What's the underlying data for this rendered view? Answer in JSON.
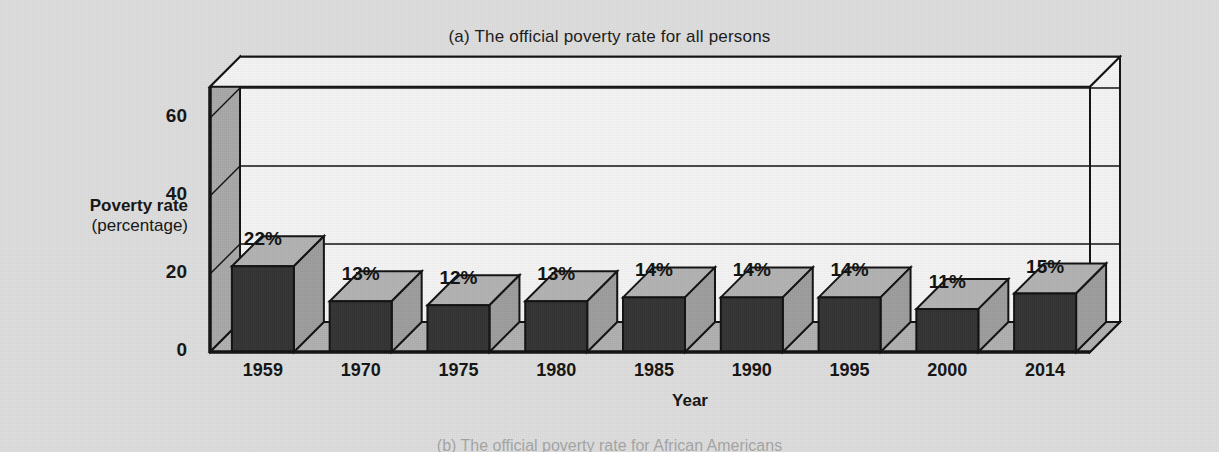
{
  "figure": {
    "title": "(a) The official poverty rate for all persons",
    "next_panel_caption": "(b) The official poverty rate for African Americans"
  },
  "axes": {
    "y_title_line1": "Poverty rate",
    "y_title_line2": "(percentage)",
    "x_title": "Year",
    "y_ticks": [
      "0",
      "20",
      "40",
      "60"
    ]
  },
  "colors": {
    "page_background": "#dddddd",
    "plot_background": "#f4f4f4",
    "bar_front": "#333333",
    "bar_top": "#b3b3b3",
    "bar_side": "#9d9d9d",
    "wall_left": "#a8a8a8",
    "floor": "#b0b0b0",
    "outline": "#111111"
  },
  "chart_data": {
    "type": "bar",
    "title": "(a) The official poverty rate for all persons",
    "xlabel": "Year",
    "ylabel": "Poverty rate (percentage)",
    "categories": [
      "1959",
      "1970",
      "1975",
      "1980",
      "1985",
      "1990",
      "1995",
      "2000",
      "2014"
    ],
    "values": [
      22,
      13,
      12,
      13,
      14,
      14,
      14,
      11,
      15
    ],
    "data_labels": [
      "22%",
      "13%",
      "12%",
      "13%",
      "14%",
      "14%",
      "14%",
      "11%",
      "15%"
    ],
    "ylim": [
      0,
      68
    ],
    "y_ticks": [
      0,
      20,
      40,
      60
    ],
    "grid": true,
    "legend": "none",
    "style": "3d-column"
  }
}
